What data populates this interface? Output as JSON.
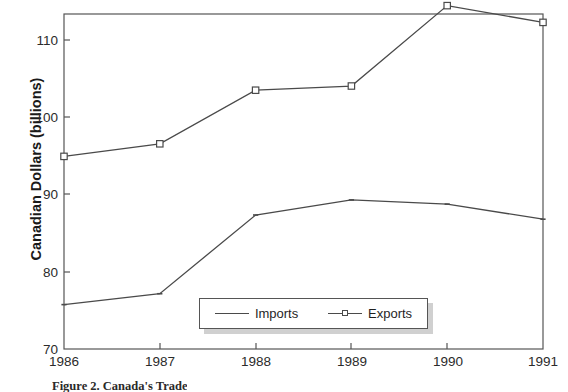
{
  "chart_data": {
    "type": "line",
    "title": "",
    "subtitle": "",
    "xlabel": "",
    "ylabel": "Canadian Dollars (billions)",
    "categories": [
      "1986",
      "1987",
      "1988",
      "1989",
      "1990",
      "1991"
    ],
    "x": [
      1986,
      1987,
      1988,
      1989,
      1990,
      1991
    ],
    "series": [
      {
        "name": "Imports",
        "marker": "none",
        "values": [
          75.3,
          76.6,
          86.0,
          87.8,
          87.3,
          85.5
        ]
      },
      {
        "name": "Exports",
        "marker": "square",
        "values": [
          93.0,
          94.5,
          100.9,
          101.4,
          111.0,
          109.0
        ]
      }
    ],
    "ylim": [
      70,
      110
    ],
    "yticks": [
      70,
      80,
      90,
      100,
      110
    ],
    "ytick_labels": [
      "70",
      "80",
      "90",
      "100",
      "110"
    ],
    "xtick_labels": [
      "1986",
      "1987",
      "1988",
      "1989",
      "1990",
      "1991"
    ],
    "grid": false,
    "legend_position": "inside-bottom-center",
    "line_color": "#4a4a4a",
    "axis_color": "#555555",
    "text_color": "#2b2b2b"
  },
  "axis": {
    "y_title": "Canadian Dollars (billions)",
    "y_labels": [
      "110",
      "100",
      "90",
      "80",
      "70"
    ],
    "x_labels": [
      "1986",
      "1987",
      "1988",
      "1989",
      "1990",
      "1991"
    ]
  },
  "legend": {
    "items": [
      {
        "label": "Imports"
      },
      {
        "label": "Exports"
      }
    ]
  },
  "caption": {
    "text": "Figure 2.  Canada's Trade"
  }
}
